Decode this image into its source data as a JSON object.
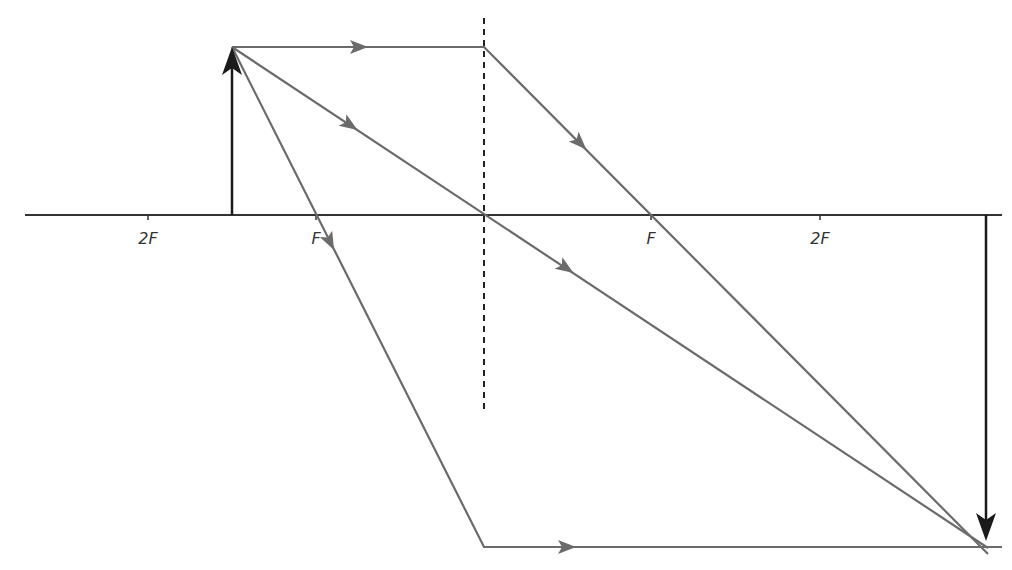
{
  "diagram": {
    "type": "converging-lens-ray-diagram",
    "colors": {
      "axis": "#333333",
      "lens": "#333333",
      "ray": "#6b6b6b",
      "object": "#1a1a1a",
      "image": "#1a1a1a"
    },
    "labels": {
      "left_2f": "2F",
      "left_f": "F",
      "right_f": "F",
      "right_2f": "2F"
    },
    "elements": {
      "principal_axis": "principal axis",
      "lens": "converging lens (dashed)",
      "object": "object arrow (upright)",
      "image": "image arrow (inverted, real)",
      "rays": [
        "parallel ray through F",
        "ray through optical centre",
        "ray through F emerging parallel"
      ]
    }
  }
}
